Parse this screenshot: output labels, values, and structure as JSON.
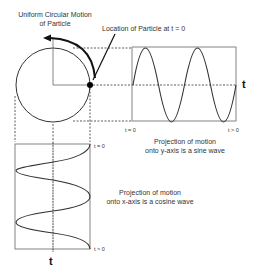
{
  "title": {
    "line1": "Uniform Circular Motion",
    "line2": "of Particle"
  },
  "particle_label": "Location of Particle at  t = 0",
  "sine_panel": {
    "start_label": "t = 0",
    "end_label": "t > 0",
    "axis_label": "t",
    "caption_line1": "Projection of motion",
    "caption_line2": "onto y-axis is a sine wave"
  },
  "cosine_panel": {
    "start_label": "t = 0",
    "end_label": "t > 0",
    "axis_label": "t",
    "caption_line1": "Projection of motion",
    "caption_line2": "onto x-axis is a cosine wave"
  },
  "colors": {
    "line": "#333333",
    "box": "#555555",
    "particle": "#000000"
  }
}
